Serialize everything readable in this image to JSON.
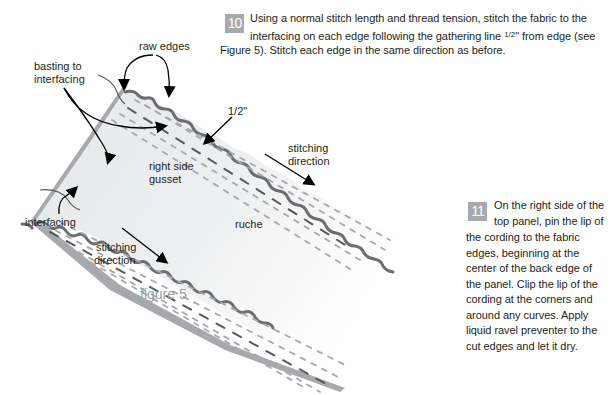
{
  "step10": {
    "number": "10",
    "line1": "Using a normal stitch length and thread tension, stitch the fabric to the",
    "line2_pre": "interfacing on each edge following the gathering line ",
    "line2_frac": "1/2",
    "line2_post": "\" from edge (see",
    "line3": "Figure 5).  Stitch each edge in the same direction as before."
  },
  "step11": {
    "number": "11",
    "lines": [
      "On the right side of the",
      "top panel, pin the lip of",
      "the cording to the fabric",
      "edges, beginning at the",
      "center of the back edge of",
      "the panel.  Clip the lip of the",
      "cording at the corners and",
      "around any curves.  Apply",
      "liquid ravel preventer to the",
      "cut edges and let it dry."
    ]
  },
  "figure": {
    "caption": "figure 5",
    "labels": {
      "raw_edges": "raw edges",
      "basting_1": "basting to",
      "basting_2": "interfacing",
      "half_inch": "1/2\"",
      "right_side": "right side",
      "gusset": "gusset",
      "stitching_top_1": "stitching",
      "stitching_top_2": "direction",
      "interfacing": "interfacing",
      "stitching_bottom_1": "stitching",
      "stitching_bottom_2": "direction",
      "ruche": "ruche"
    },
    "colors": {
      "badge": "#a7a9ac",
      "fabric_fill": "#e6e7e8",
      "interfacing": "#a7a9ac",
      "raw_edge": "#6d6e71",
      "stitch_dark": "#58595b",
      "stitch_light": "#a7a9ac",
      "caption": "#9d9fa2"
    }
  }
}
